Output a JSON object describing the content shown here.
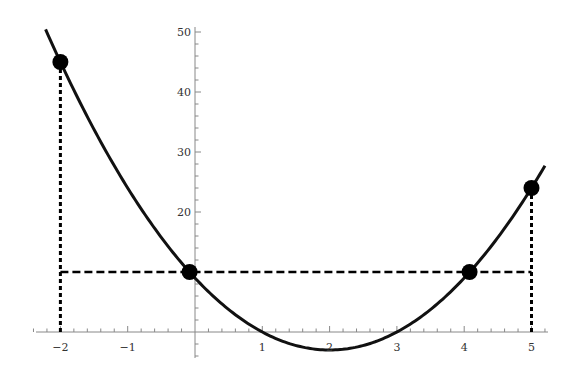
{
  "chart_data": {
    "type": "line",
    "title": "",
    "xlabel": "",
    "ylabel": "",
    "function": "f(x) = 3x^2 - 12x + 9",
    "coefficients": {
      "a": 3,
      "b": -12,
      "c": 9
    },
    "x_range": [
      -2.22,
      5.2
    ],
    "xlim": [
      -2.4,
      5.3
    ],
    "ylim": [
      -4,
      51
    ],
    "x_ticks": [
      -2,
      -1,
      1,
      2,
      3,
      4,
      5
    ],
    "x_tick_labels": [
      "−2",
      "−1",
      "1",
      "2",
      "3",
      "4",
      "5"
    ],
    "y_ticks": [
      20,
      30,
      40,
      50
    ],
    "y_tick_labels": [
      "20",
      "30",
      "40",
      "50"
    ],
    "grid": false,
    "legend": null,
    "points": [
      {
        "x": -2,
        "y": 45
      },
      {
        "x": -0.08,
        "y": 10
      },
      {
        "x": 4.08,
        "y": 10
      },
      {
        "x": 5,
        "y": 24
      }
    ],
    "reference_lines": [
      {
        "type": "horizontal-dashed",
        "y": 10,
        "x_from": -2,
        "x_to": 5
      },
      {
        "type": "vertical-dotted",
        "x": -2,
        "y_from": 0,
        "y_to": 45
      },
      {
        "type": "vertical-dotted",
        "x": 5,
        "y_from": 0,
        "y_to": 24
      }
    ],
    "colors": {
      "curve": "#111111",
      "axes": "#888888",
      "points": "#000000"
    }
  }
}
